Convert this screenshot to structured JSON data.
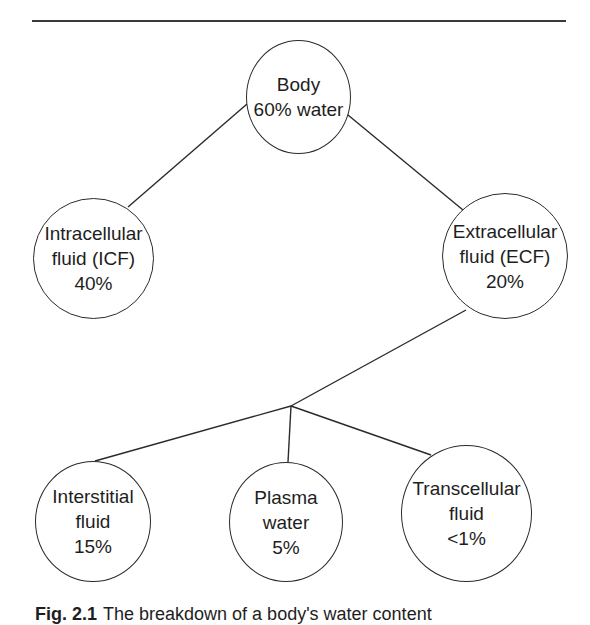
{
  "diagram": {
    "type": "tree",
    "nodes": {
      "body": {
        "title": "Body",
        "line2": "60% water"
      },
      "icf": {
        "line1": "Intracellular",
        "line2": "fluid (ICF)",
        "value": "40%"
      },
      "ecf": {
        "line1": "Extracellular",
        "line2": "fluid (ECF)",
        "value": "20%"
      },
      "interstitial": {
        "line1": "Interstitial",
        "line2": "fluid",
        "value": "15%"
      },
      "plasma": {
        "line1": "Plasma",
        "line2": "water",
        "value": "5%"
      },
      "transcellular": {
        "line1": "Transcellular",
        "line2": "fluid",
        "value": "<1%"
      }
    },
    "edges": [
      [
        "body",
        "icf"
      ],
      [
        "body",
        "ecf"
      ],
      [
        "ecf",
        "interstitial"
      ],
      [
        "ecf",
        "plasma"
      ],
      [
        "ecf",
        "transcellular"
      ]
    ]
  },
  "caption": {
    "label": "Fig. 2.1",
    "text": "The breakdown of a body's water content"
  }
}
